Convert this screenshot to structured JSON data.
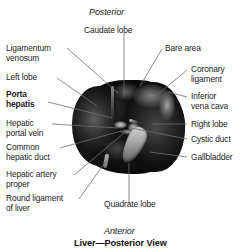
{
  "figure": {
    "title": "Liver—Posterior View",
    "orientation": {
      "top": "Posterior",
      "bottom": "Anterior"
    }
  },
  "labels": {
    "caudate_lobe": "Caudate lobe",
    "bare_area": "Bare area",
    "coronary_ligament_l1": "Coronary",
    "coronary_ligament_l2": "ligament",
    "inferior_vena_cava_l1": "Inferior",
    "inferior_vena_cava_l2": "vena cava",
    "right_lobe": "Right lobe",
    "cystic_duct": "Cystic duct",
    "gallbladder": "Gallbladder",
    "ligamentum_venosum_l1": "Ligamentum",
    "ligamentum_venosum_l2": "venosum",
    "left_lobe": "Left lobe",
    "porta_hepatis_l1": "Porta",
    "porta_hepatis_l2": "hepatis",
    "hepatic_portal_vein_l1": "Hepatic",
    "hepatic_portal_vein_l2": "portal vein",
    "common_hepatic_duct_l1": "Common",
    "common_hepatic_duct_l2": "hepatic duct",
    "hepatic_artery_proper_l1": "Hepatic artery",
    "hepatic_artery_proper_l2": "proper",
    "round_ligament_l1": "Round ligament",
    "round_ligament_l2": "of liver",
    "quadrate_lobe": "Quadrate lobe"
  },
  "colors": {
    "background": "#ffffff",
    "text": "#1b1b1b",
    "leader_line": "#6e6e6e",
    "organ_dark": "#141414",
    "organ_light": "#d9d9d9"
  }
}
